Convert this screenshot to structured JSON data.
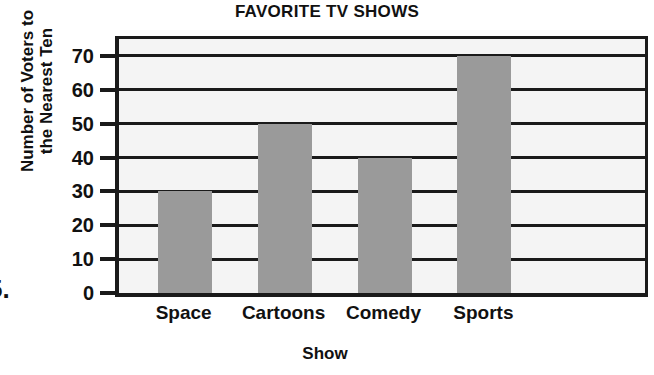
{
  "question_number": "5.",
  "chart_data": {
    "type": "bar",
    "title": "FAVORITE TV SHOWS",
    "xlabel": "Show",
    "ylabel": "Number of Voters to the Nearest Ten",
    "ylabel_lines": [
      "Number of Voters to",
      "the Nearest Ten"
    ],
    "categories": [
      "Space",
      "Cartoons",
      "Comedy",
      "Sports"
    ],
    "values": [
      30,
      50,
      40,
      70
    ],
    "ylim": [
      0,
      75
    ],
    "yticks": [
      0,
      10,
      20,
      30,
      40,
      50,
      60,
      70
    ],
    "ytick_labels": [
      "0",
      "10",
      "20",
      "30",
      "40",
      "50",
      "60",
      "70"
    ],
    "grid": true,
    "legend": "none",
    "bar_color": "#9a9a9a",
    "axis_color": "#1a1a1a",
    "plot_background": "#f4f4f4"
  }
}
